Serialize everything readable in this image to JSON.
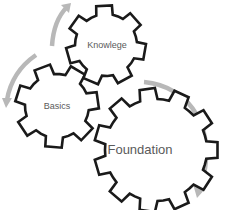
{
  "diagram": {
    "type": "cycle-gears",
    "colors": {
      "gear_stroke": "#1a1a1a",
      "gear_fill": "#ffffff",
      "arrow": "#b8b8b8",
      "label": "#5a5a5a"
    },
    "gears": [
      {
        "id": "knowlege",
        "label": "Knowlege",
        "cx": 106,
        "cy": 45,
        "r_outer": 40,
        "r_inner": 31,
        "teeth": 7,
        "rotation": 10
      },
      {
        "id": "basics",
        "label": "Basics",
        "cx": 57,
        "cy": 106,
        "r_outer": 42,
        "r_inner": 32,
        "teeth": 7,
        "rotation": -8
      },
      {
        "id": "foundation",
        "label": "Foundation",
        "cx": 156,
        "cy": 150,
        "r_outer": 62,
        "r_inner": 51,
        "teeth": 11,
        "rotation": 0
      }
    ],
    "arrows": [
      {
        "id": "arrow-basics-to-knowlege",
        "direction": "up"
      },
      {
        "id": "arrow-knowlege-to-basics",
        "direction": "down-left"
      },
      {
        "id": "arrow-foundation",
        "direction": "clockwise-down"
      }
    ]
  }
}
